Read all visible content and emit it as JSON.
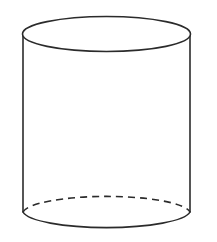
{
  "figure": {
    "kind": "geometric-solid-line-drawing",
    "name": "cylinder",
    "background_color": "#ffffff",
    "stroke_color": "#2b2b2b",
    "stroke_width": 1.6,
    "canvas": {
      "width": 217,
      "height": 242
    },
    "geometry": {
      "center_x": 106.5,
      "radius_x": 84,
      "radius_y": 17.5,
      "top_ellipse_center_y": 34,
      "bottom_ellipse_center_y": 212,
      "left_wall_x": 23,
      "right_wall_x": 190,
      "wall_top_y": 34,
      "wall_bottom_y": 212,
      "body_height": 178
    },
    "parts": [
      {
        "id": "top-ellipse",
        "label": "Top circular face",
        "line_style": "solid",
        "visible": "full-ellipse"
      },
      {
        "id": "left-wall",
        "label": "Left side edge",
        "line_style": "solid",
        "visible": "vertical-line"
      },
      {
        "id": "right-wall",
        "label": "Right side edge",
        "line_style": "solid",
        "visible": "vertical-line"
      },
      {
        "id": "bottom-front-arc",
        "label": "Bottom front arc",
        "line_style": "solid",
        "visible": "lower-half-arc"
      },
      {
        "id": "bottom-back-arc",
        "label": "Bottom hidden back arc",
        "line_style": "dashed",
        "dash_pattern": "7 5",
        "visible": "upper-half-arc"
      }
    ],
    "labels": [],
    "annotations": []
  }
}
